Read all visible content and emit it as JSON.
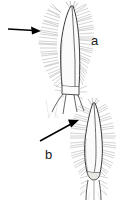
{
  "figure": {
    "type": "scientific-line-drawing",
    "width": 121,
    "height": 201,
    "background_color": "#ffffff",
    "ink_color": "#4a4a4a",
    "outline_color": "#2b2b2b",
    "arrow_color": "#000000",
    "label_color": "#1a1a1a"
  },
  "panels": [
    {
      "id": "a",
      "label": "a",
      "label_x": 91,
      "label_y": 34,
      "description": "elongate parallel-sided segment densely fringed with fine setae on both margins, apex pointed, base with articulated joint bearing divergent spines",
      "apex_x": 72,
      "apex_y": 5,
      "base_x": 70,
      "base_y": 92,
      "shaft_left": 58,
      "shaft_right": 79
    },
    {
      "id": "b",
      "label": "b",
      "label_x": 45,
      "label_y": 148,
      "description": "tapered lanceolate segment with pointed apex, dense setal fringe on both margins, rounded bulbous basal joint with short setae",
      "apex_x": 93,
      "apex_y": 102,
      "base_x": 92,
      "base_y": 172,
      "shaft_left": 83,
      "shaft_right": 103
    }
  ],
  "arrows": [
    {
      "id": "arrow-a",
      "points_to": "a",
      "orientation": "horizontal",
      "tail_x": 8,
      "tail_y": 29,
      "tip_x": 41,
      "tip_y": 31
    },
    {
      "id": "arrow-b",
      "points_to": "b",
      "orientation": "diagonal-up-right",
      "tail_x": 40,
      "tail_y": 141,
      "tip_x": 79,
      "tip_y": 120
    }
  ]
}
